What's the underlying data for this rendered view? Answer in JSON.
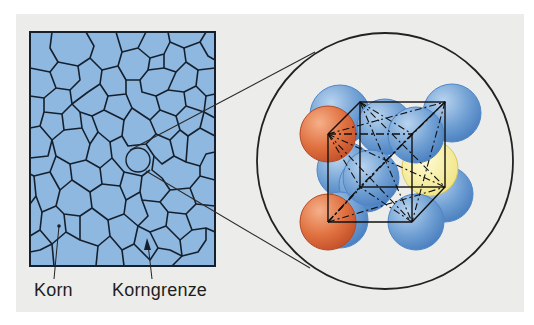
{
  "figure": {
    "labels": {
      "grain": "Korn",
      "grain_boundary": "Korngrenze"
    },
    "colors": {
      "background": "#ececea",
      "grain_fill": "#8fb8e0",
      "grain_boundary": "#15202e",
      "atom_blue": "#6f9fd3",
      "atom_orange": "#e0703f",
      "atom_yellow": "#f5ee9a",
      "outline": "#222222"
    },
    "parts": {
      "microstructure": "grain structure square",
      "magnifier": "magnified crystal lattice circle",
      "lattice": "cubic unit cell with atoms"
    }
  }
}
